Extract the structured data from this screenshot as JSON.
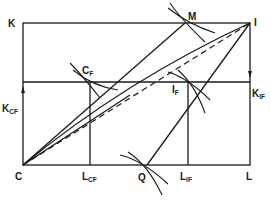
{
  "diagram": {
    "type": "edgeworth-box",
    "labels": {
      "K": "K",
      "I": "I",
      "C": "C",
      "L": "L",
      "M": "M",
      "Q": "Q",
      "CF_main": "C",
      "CF_sub": "F",
      "IF_main": "I",
      "IF_sub": "F",
      "KCF_main": "K",
      "KCF_sub": "CF",
      "KIF_main": "K",
      "KIF_sub": "IF",
      "LCF_main": "L",
      "LCF_sub": "CF",
      "LIF_main": "L",
      "LIF_sub": "IF"
    },
    "points": {
      "K": [
        23,
        23
      ],
      "I": [
        250,
        23
      ],
      "C": [
        23,
        165
      ],
      "L": [
        250,
        165
      ],
      "M": [
        185,
        23
      ],
      "C_F": [
        90,
        82
      ],
      "I_F": [
        188,
        82
      ],
      "Q": [
        147,
        165
      ],
      "L_CF": [
        90,
        165
      ],
      "L_IF": [
        188,
        165
      ],
      "K_CF": [
        23,
        82
      ],
      "K_IF": [
        250,
        82
      ]
    },
    "colors": {
      "ink": "#1a1a1a",
      "background": "#ffffff"
    }
  }
}
